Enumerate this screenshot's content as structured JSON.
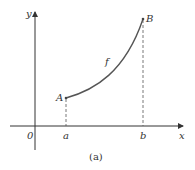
{
  "figure": {
    "caption": "(a)",
    "axes": {
      "x_label": "x",
      "y_label": "y",
      "origin_label": "0"
    },
    "ticks": {
      "a_label": "a",
      "b_label": "b"
    },
    "points": {
      "A_label": "A",
      "B_label": "B"
    },
    "curve_label": "f",
    "colors": {
      "curve": "#555555",
      "axes": "#333333",
      "dashes": "#555555"
    }
  }
}
